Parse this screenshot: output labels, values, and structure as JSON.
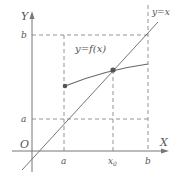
{
  "diagram": {
    "type": "fixed-point-illustration",
    "colors": {
      "line": "#777777",
      "dash": "#888888",
      "text": "#555555",
      "point": "#555555"
    },
    "labels": {
      "y_axis": "Y",
      "x_axis": "X",
      "origin": "O",
      "b_y": "b",
      "a_y": "a",
      "a_x": "a",
      "x0": "x",
      "x0_sub": "0",
      "b_x": "b",
      "func": "y=f(x)",
      "diag": "y=x"
    }
  }
}
